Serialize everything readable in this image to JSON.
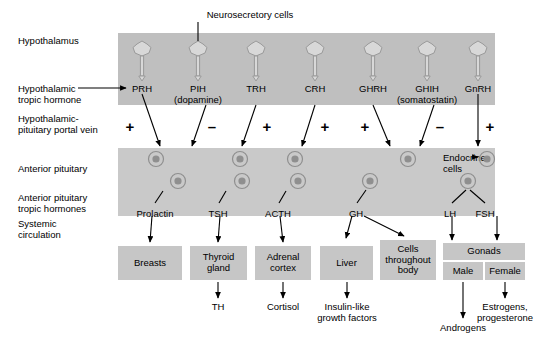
{
  "diagram": {
    "colors": {
      "band": "#bfbfbf",
      "band_light": "#c9c9c9",
      "box": "#c6c6c6",
      "ink": "#000000"
    }
  },
  "row_labels": [
    {
      "name": "hypothalamus",
      "text": "Hypothalamus"
    },
    {
      "name": "hypothalamic-tropic-hormone",
      "text": "Hypothalamic\ntropic hormone"
    },
    {
      "name": "hypothalamic-pituitary-portal-vein",
      "text": "Hypothalamic-\npituitary portal vein"
    },
    {
      "name": "anterior-pituitary",
      "text": "Anterior pituitary"
    },
    {
      "name": "anterior-pituitary-tropic-hormones",
      "text": "Anterior pituitary\ntropic hormones"
    },
    {
      "name": "systemic-circulation",
      "text": "Systemic\ncirculation"
    }
  ],
  "callouts": {
    "neurosecretory_cells": "Neurosecretory cells",
    "endocrine_cells": "Endocrine\ncells"
  },
  "hypothalamic_hormones": [
    {
      "abbr": "PRH",
      "full": "",
      "sign": "+"
    },
    {
      "abbr": "PIH",
      "full": "(dopamine)",
      "sign": "–"
    },
    {
      "abbr": "TRH",
      "full": "",
      "sign": "+"
    },
    {
      "abbr": "CRH",
      "full": "",
      "sign": "+"
    },
    {
      "abbr": "GHRH",
      "full": "",
      "sign": "+"
    },
    {
      "abbr": "GHIH",
      "full": "(somatostatin)",
      "sign": "–"
    },
    {
      "abbr": "GnRH",
      "full": "",
      "sign": "+"
    }
  ],
  "pituitary_hormones": [
    {
      "abbr": "Prolactin"
    },
    {
      "abbr": "TSH"
    },
    {
      "abbr": "ACTH"
    },
    {
      "abbr": "GH"
    },
    {
      "abbr": "LH"
    },
    {
      "abbr": "FSH"
    }
  ],
  "target_tissues": [
    {
      "name": "breasts",
      "text": "Breasts"
    },
    {
      "name": "thyroid-gland",
      "text": "Thyroid\ngland"
    },
    {
      "name": "adrenal-cortex",
      "text": "Adrenal\ncortex"
    },
    {
      "name": "liver",
      "text": "Liver"
    },
    {
      "name": "cells-throughout-body",
      "text": "Cells\nthroughout\nbody"
    },
    {
      "name": "gonads",
      "text": "Gonads"
    },
    {
      "name": "gonads-male",
      "text": "Male"
    },
    {
      "name": "gonads-female",
      "text": "Female"
    }
  ],
  "end_products": [
    {
      "name": "th",
      "text": "TH"
    },
    {
      "name": "cortisol",
      "text": "Cortisol"
    },
    {
      "name": "insulin-like-growth-factors",
      "text": "Insulin-like\ngrowth factors"
    },
    {
      "name": "androgens",
      "text": "Androgens"
    },
    {
      "name": "estrogens-progesterone",
      "text": "Estrogens,\nprogesterone"
    }
  ]
}
